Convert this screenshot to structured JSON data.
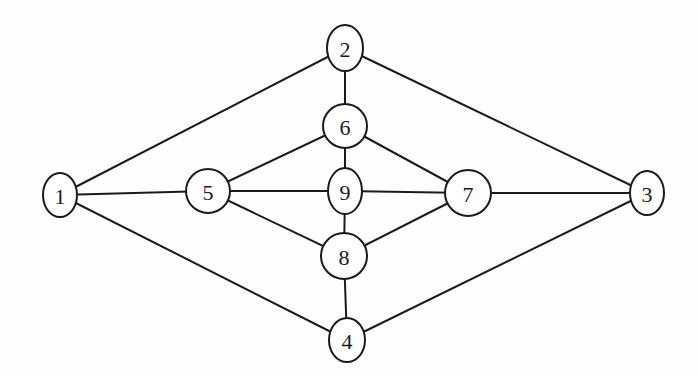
{
  "diagram": {
    "type": "undirected-graph",
    "nodes": [
      {
        "id": "1",
        "label": "1",
        "x": 60,
        "y": 195,
        "rx": 17,
        "ry": 22
      },
      {
        "id": "2",
        "label": "2",
        "x": 345,
        "y": 48,
        "rx": 18,
        "ry": 23
      },
      {
        "id": "3",
        "label": "3",
        "x": 647,
        "y": 193,
        "rx": 17,
        "ry": 22
      },
      {
        "id": "4",
        "label": "4",
        "x": 347,
        "y": 340,
        "rx": 18,
        "ry": 22
      },
      {
        "id": "5",
        "label": "5",
        "x": 208,
        "y": 191,
        "rx": 22,
        "ry": 22
      },
      {
        "id": "6",
        "label": "6",
        "x": 345,
        "y": 126,
        "rx": 22,
        "ry": 22
      },
      {
        "id": "7",
        "label": "7",
        "x": 468,
        "y": 193,
        "rx": 23,
        "ry": 23
      },
      {
        "id": "8",
        "label": "8",
        "x": 344,
        "y": 256,
        "rx": 23,
        "ry": 23
      },
      {
        "id": "9",
        "label": "9",
        "x": 345,
        "y": 191,
        "rx": 17,
        "ry": 23
      }
    ],
    "edges": [
      [
        "1",
        "2"
      ],
      [
        "1",
        "5"
      ],
      [
        "1",
        "4"
      ],
      [
        "2",
        "6"
      ],
      [
        "2",
        "3"
      ],
      [
        "5",
        "6"
      ],
      [
        "5",
        "9"
      ],
      [
        "5",
        "8"
      ],
      [
        "6",
        "9"
      ],
      [
        "6",
        "7"
      ],
      [
        "9",
        "7"
      ],
      [
        "9",
        "8"
      ],
      [
        "8",
        "7"
      ],
      [
        "8",
        "4"
      ],
      [
        "7",
        "3"
      ],
      [
        "4",
        "3"
      ]
    ],
    "colors": {
      "stroke": "#1a1a1a",
      "fill": "#ffffff",
      "background": "#fefefe"
    }
  }
}
